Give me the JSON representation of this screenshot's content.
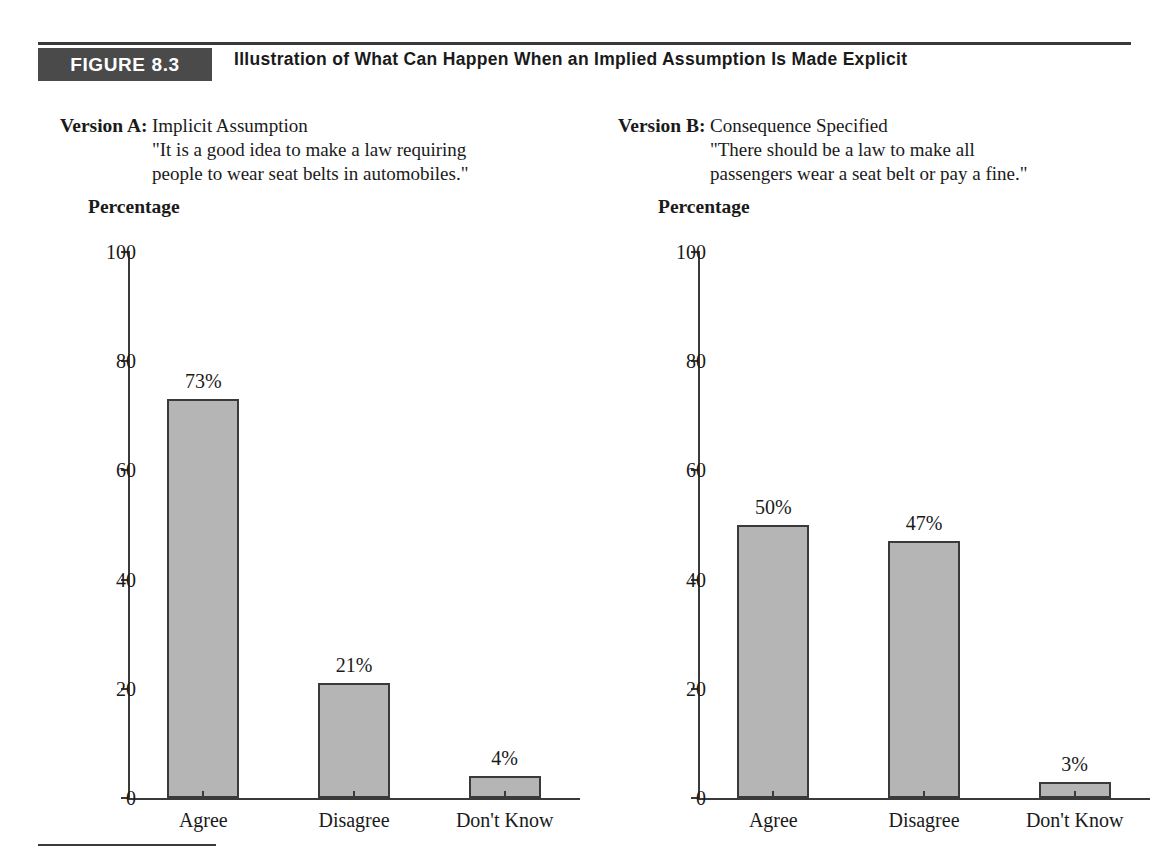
{
  "figure": {
    "tag": "FIGURE 8.3",
    "title": "Illustration of What Can Happen When an Implied Assumption Is Made Explicit",
    "tag_background": "#4a4a4a",
    "rule_color": "#3a3a3a"
  },
  "versions": [
    {
      "label": "Version A:",
      "heading": "Implicit Assumption",
      "quote_line1": "\"It is a good idea to make a law requiring",
      "quote_line2": "people to wear seat belts in automobiles.\""
    },
    {
      "label": "Version B:",
      "heading": "Consequence Specified",
      "quote_line1": "\"There should be a law to make all",
      "quote_line2": "passengers wear a seat belt or pay a fine.\""
    }
  ],
  "axis_title": "Percentage",
  "yticks": [
    "100",
    "80",
    "60",
    "40",
    "20",
    "0"
  ],
  "chart_data": [
    {
      "type": "bar",
      "title": "Version A: Implicit Assumption",
      "categories": [
        "Agree",
        "Disagree",
        "Don't Know"
      ],
      "values": [
        73,
        21,
        4
      ],
      "labels": [
        "73%",
        "21%",
        "4%"
      ],
      "xlabel": "",
      "ylabel": "Percentage",
      "ylim": [
        0,
        100
      ],
      "yticks": [
        0,
        20,
        40,
        60,
        80,
        100
      ],
      "grid": false,
      "legend": "none",
      "bar_fill": "#b5b5b5",
      "bar_border": "#3a3a3a"
    },
    {
      "type": "bar",
      "title": "Version B: Consequence Specified",
      "categories": [
        "Agree",
        "Disagree",
        "Don't Know"
      ],
      "values": [
        50,
        47,
        3
      ],
      "labels": [
        "50%",
        "47%",
        "3%"
      ],
      "xlabel": "",
      "ylabel": "Percentage",
      "ylim": [
        0,
        100
      ],
      "yticks": [
        0,
        20,
        40,
        60,
        80,
        100
      ],
      "grid": false,
      "legend": "none",
      "bar_fill": "#b5b5b5",
      "bar_border": "#3a3a3a"
    }
  ]
}
